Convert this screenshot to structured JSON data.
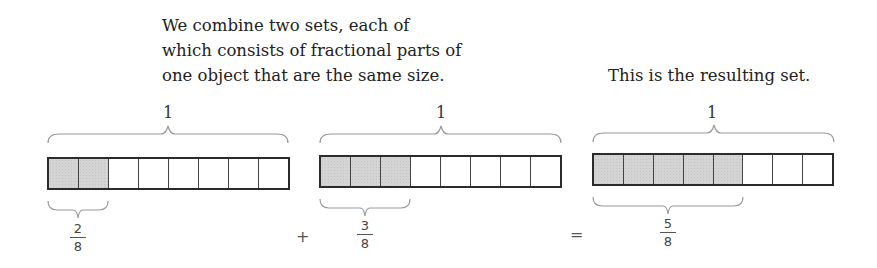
{
  "captions": {
    "left_lines": [
      "We combine two sets, each of",
      "which consists of fractional parts of",
      "one object that are the same size."
    ],
    "right": "This is the resulting set."
  },
  "whole_label": "1",
  "operators": {
    "plus": "+",
    "equals": "="
  },
  "bars": [
    {
      "id": "first",
      "total_parts": 8,
      "shaded": 2,
      "fraction": {
        "numerator": "2",
        "denominator": "8"
      }
    },
    {
      "id": "second",
      "total_parts": 8,
      "shaded": 3,
      "fraction": {
        "numerator": "3",
        "denominator": "8"
      }
    },
    {
      "id": "result",
      "total_parts": 8,
      "shaded": 5,
      "fraction": {
        "numerator": "5",
        "denominator": "8"
      }
    }
  ],
  "colors": {
    "shaded": "#d4d4d4",
    "outline": "#2b2b2b",
    "brace": "#9a9a9a"
  }
}
